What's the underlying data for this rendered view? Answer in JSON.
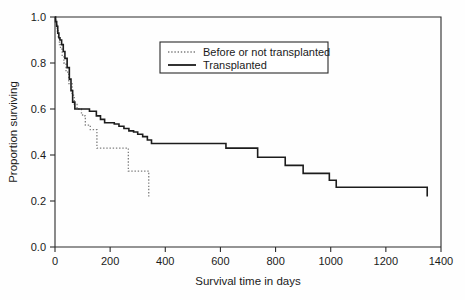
{
  "chart_data": {
    "type": "line",
    "title": "",
    "xlabel": "Survival time in days",
    "ylabel": "Proportion surviving",
    "xlim": [
      0,
      1400
    ],
    "ylim": [
      0.0,
      1.0
    ],
    "xticks": [
      0,
      200,
      400,
      600,
      800,
      1000,
      1200,
      1400
    ],
    "xtick_labels": [
      "0",
      "200",
      "400",
      "600",
      "800",
      "1000",
      "1200",
      "1400"
    ],
    "yticks": [
      0.0,
      0.2,
      0.4,
      0.6,
      0.8,
      1.0
    ],
    "ytick_labels": [
      "0.0",
      "0.2",
      "0.4",
      "0.6",
      "0.8",
      "1.0"
    ],
    "grid": false,
    "legend_position": "upper center",
    "step_style": "post",
    "series": [
      {
        "name": "Before or not transplanted",
        "style": "dotted",
        "color": "#7d7d7d",
        "x": [
          0,
          3,
          8,
          12,
          16,
          20,
          26,
          32,
          40,
          50,
          62,
          70,
          80,
          96,
          100,
          110,
          128,
          148,
          152,
          260,
          266,
          340
        ],
        "y": [
          1.0,
          0.97,
          0.94,
          0.91,
          0.88,
          0.86,
          0.83,
          0.8,
          0.76,
          0.71,
          0.66,
          0.62,
          0.6,
          0.58,
          0.57,
          0.53,
          0.51,
          0.51,
          0.43,
          0.43,
          0.33,
          0.33
        ],
        "final_drop_y": 0.22
      },
      {
        "name": "Transplanted",
        "style": "solid",
        "color": "#1c1c1c",
        "x": [
          0,
          2,
          6,
          10,
          14,
          18,
          24,
          30,
          36,
          44,
          52,
          58,
          64,
          72,
          100,
          125,
          150,
          165,
          180,
          200,
          215,
          232,
          250,
          268,
          285,
          300,
          318,
          335,
          350,
          545,
          620,
          722,
          735,
          835,
          890,
          900,
          995,
          1020,
          1350
        ],
        "y": [
          1.0,
          0.98,
          0.96,
          0.93,
          0.91,
          0.9,
          0.88,
          0.85,
          0.82,
          0.78,
          0.73,
          0.68,
          0.63,
          0.6,
          0.6,
          0.59,
          0.57,
          0.555,
          0.54,
          0.54,
          0.535,
          0.525,
          0.515,
          0.505,
          0.5,
          0.49,
          0.48,
          0.465,
          0.45,
          0.45,
          0.43,
          0.43,
          0.39,
          0.355,
          0.355,
          0.32,
          0.29,
          0.26,
          0.26
        ],
        "final_drop_y": 0.22
      }
    ],
    "legend_entries": [
      {
        "label": "Before or not transplanted",
        "style": "dotted"
      },
      {
        "label": "Transplanted",
        "style": "solid"
      }
    ]
  }
}
